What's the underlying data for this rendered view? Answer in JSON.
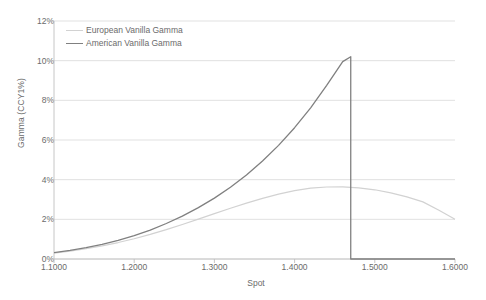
{
  "chart_data": {
    "type": "line",
    "title": "",
    "xlabel": "Spot",
    "ylabel": "Gamma (CCY1%)",
    "xlim": [
      1.1,
      1.6
    ],
    "ylim": [
      0,
      0.12
    ],
    "grid": true,
    "legend_position": "top-left",
    "x_tick_labels": [
      "1.1000",
      "1.2000",
      "1.3000",
      "1.4000",
      "1.5000",
      "1.6000"
    ],
    "x_tick_values": [
      1.1,
      1.2,
      1.3,
      1.4,
      1.5,
      1.6
    ],
    "y_tick_labels": [
      "0%",
      "2%",
      "4%",
      "6%",
      "8%",
      "10%",
      "12%"
    ],
    "y_tick_values": [
      0,
      0.02,
      0.04,
      0.06,
      0.08,
      0.1,
      0.12
    ],
    "series": [
      {
        "name": "European Vanilla Gamma",
        "color": "#d2d2d2",
        "width": 1.2,
        "x": [
          1.1,
          1.12,
          1.14,
          1.16,
          1.18,
          1.2,
          1.22,
          1.24,
          1.26,
          1.28,
          1.3,
          1.32,
          1.34,
          1.36,
          1.38,
          1.4,
          1.42,
          1.44,
          1.46,
          1.48,
          1.5,
          1.52,
          1.54,
          1.56,
          1.58,
          1.6
        ],
        "values": [
          0.003,
          0.004,
          0.0052,
          0.0066,
          0.0083,
          0.0102,
          0.0124,
          0.0148,
          0.0174,
          0.0201,
          0.0229,
          0.0256,
          0.0282,
          0.0306,
          0.0327,
          0.0345,
          0.0357,
          0.0363,
          0.0364,
          0.0359,
          0.0349,
          0.0333,
          0.0313,
          0.0288,
          0.0246,
          0.02
        ]
      },
      {
        "name": "American Vanilla Gamma",
        "color": "#808080",
        "width": 1.3,
        "x": [
          1.1,
          1.12,
          1.14,
          1.16,
          1.18,
          1.2,
          1.22,
          1.24,
          1.26,
          1.28,
          1.3,
          1.32,
          1.34,
          1.36,
          1.38,
          1.4,
          1.42,
          1.44,
          1.46,
          1.47,
          1.47,
          1.6
        ],
        "values": [
          0.0032,
          0.0043,
          0.0057,
          0.0074,
          0.0094,
          0.0118,
          0.0146,
          0.0179,
          0.0216,
          0.0259,
          0.0307,
          0.0362,
          0.0424,
          0.0494,
          0.0573,
          0.0662,
          0.0762,
          0.0875,
          0.0995,
          0.102,
          0.0,
          0.0
        ]
      }
    ],
    "annotations": {
      "american_peak_spot": 1.47,
      "american_peak_gamma": 0.102,
      "european_peak_spot": 1.46,
      "european_peak_gamma": 0.0364,
      "barrier_drop_spot": 1.47
    }
  },
  "caption": {
    "text": ""
  }
}
